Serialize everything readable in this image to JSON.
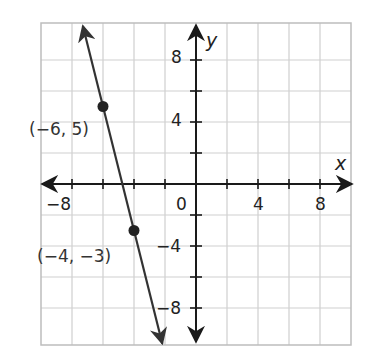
{
  "chart_data": {
    "type": "line",
    "title": "",
    "xlabel": "x",
    "ylabel": "y",
    "xlim": [
      -10,
      10
    ],
    "ylim": [
      -10,
      10
    ],
    "grid": true,
    "grid_step": 2,
    "x_ticks": [
      -8,
      -6,
      -4,
      -2,
      2,
      4,
      6,
      8
    ],
    "y_ticks": [
      -8,
      -6,
      -4,
      -2,
      2,
      4,
      6,
      8
    ],
    "x_tick_labels": [
      {
        "value": -8,
        "text": "−8"
      },
      {
        "value": 0,
        "text": "0"
      },
      {
        "value": 4,
        "text": "4"
      },
      {
        "value": 8,
        "text": "8"
      }
    ],
    "y_tick_labels": [
      {
        "value": 8,
        "text": "8"
      },
      {
        "value": 4,
        "text": "4"
      },
      {
        "value": -4,
        "text": "−4"
      },
      {
        "value": -8,
        "text": "−8"
      }
    ],
    "series": [
      {
        "name": "line",
        "slope": -4,
        "intercept": -19,
        "extends_both_directions": true,
        "points": [
          {
            "x": -6,
            "y": 5,
            "label": "(−6, 5)"
          },
          {
            "x": -4,
            "y": -3,
            "label": "(−4, −3)"
          }
        ]
      }
    ]
  },
  "labels": {
    "x_axis": "x",
    "y_axis": "y",
    "origin": "0",
    "xm8": "−8",
    "x4": "4",
    "x8": "8",
    "y8": "8",
    "y4": "4",
    "ym4": "−4",
    "ym8": "−8",
    "p1": "(−6, 5)",
    "p2": "(−4, −3)"
  },
  "colors": {
    "grid": "#cfcfcf",
    "border": "#bdbdbd",
    "axis": "#1a1a1a",
    "line": "#333333",
    "point": "#222222"
  }
}
